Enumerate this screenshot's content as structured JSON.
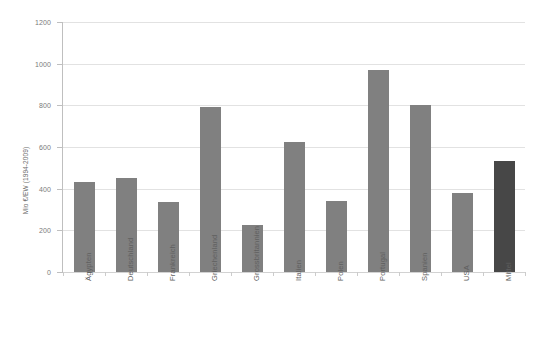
{
  "chart_data": {
    "type": "bar",
    "title": "",
    "subtitle": "",
    "xlabel": "",
    "ylabel": "Mio €/EW (1994-2009)",
    "ylim": [
      0,
      1200
    ],
    "ytick_labels": [
      "0",
      "200",
      "400",
      "600",
      "800",
      "1000",
      "1200"
    ],
    "ytick_values": [
      0,
      200,
      400,
      600,
      800,
      1000,
      1200
    ],
    "grid": true,
    "legend": "none",
    "categories": [
      "Ägypten",
      "Deutschland",
      "Frankreich",
      "Griechenland",
      "Grossbritannien",
      "Italien",
      "Polen",
      "Portugal",
      "Spanien",
      "USA",
      "Mittel"
    ],
    "values": [
      430,
      450,
      335,
      790,
      225,
      625,
      340,
      970,
      800,
      380,
      535
    ],
    "bar_colors": [
      "#808080",
      "#808080",
      "#808080",
      "#808080",
      "#808080",
      "#808080",
      "#808080",
      "#808080",
      "#808080",
      "#808080",
      "#474747"
    ],
    "highlight_category": "Mittel",
    "highlight_color": "#474747",
    "series_color": "#808080",
    "gridline_color": "#e2e2e2",
    "axis_color": "#bfbfbf",
    "background_color": "#ffffff"
  }
}
